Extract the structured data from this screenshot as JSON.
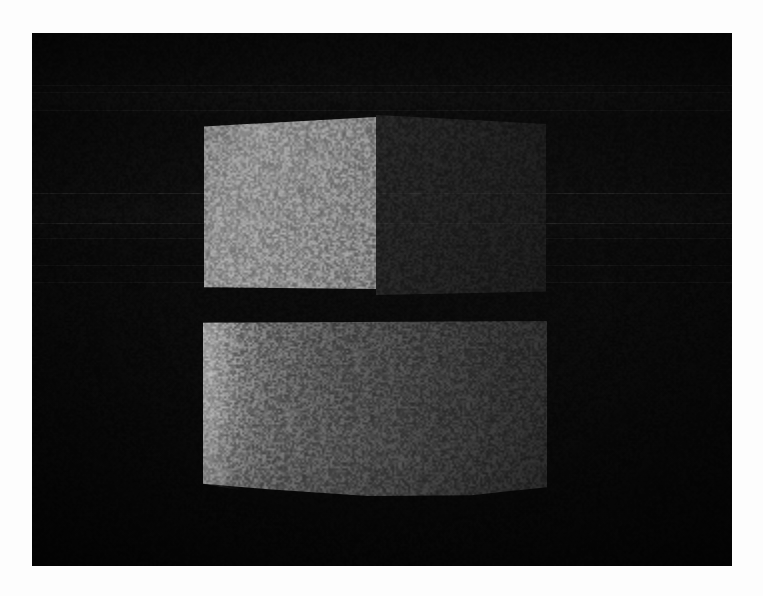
{
  "scene": {
    "title": "3D render viewport",
    "description": "Dark 3D rendered scene showing four-quadrant window-logo geometry",
    "background_color": "#080808",
    "border_color": "#fdfdfd",
    "canvas": {
      "x": 32,
      "y": 33,
      "width": 700,
      "height": 533
    }
  },
  "panels": [
    {
      "id": "top-left",
      "name": "upper-left-bright-face",
      "fill_start": "#989898",
      "fill_end": "#858585",
      "brightness_label": "bright",
      "x": 172,
      "y": 84,
      "width": 172,
      "height": 172
    },
    {
      "id": "top-right",
      "name": "upper-right-dark-face",
      "fill_start": "#242424",
      "fill_end": "#1a1a1a",
      "brightness_label": "dark",
      "x": 344,
      "y": 82,
      "width": 170,
      "height": 180
    },
    {
      "id": "bottom",
      "name": "lower-wide-face",
      "fill_start": "#9a9a9a",
      "fill_end": "#2b2b2b",
      "brightness_label": "gradient",
      "x": 171,
      "y": 288,
      "width": 344,
      "height": 175
    }
  ],
  "scanlines": {
    "backdrop_y": [
      52,
      59,
      77,
      160,
      190,
      205,
      232,
      249
    ],
    "overlay_y": [
      160,
      190
    ]
  },
  "effects": {
    "grain": "film-grain-noise",
    "vignette": "radial-darkening",
    "grain_opacity": "0.55"
  }
}
